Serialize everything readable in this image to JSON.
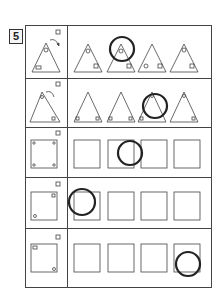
{
  "question": {
    "number": "5"
  },
  "rows": [
    {
      "shape": "triangle",
      "answer_index": 1
    },
    {
      "shape": "triangle",
      "answer_index": 2
    },
    {
      "shape": "square",
      "answer_index": 2
    },
    {
      "shape": "square",
      "answer_index": 0
    },
    {
      "shape": "square",
      "answer_index": 3
    }
  ],
  "colors": {
    "line": "#444444",
    "circle": "#222222"
  }
}
